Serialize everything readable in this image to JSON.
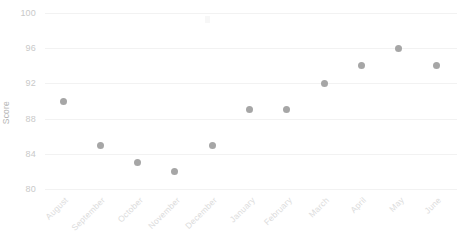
{
  "chart_data": {
    "type": "scatter",
    "title": "",
    "xlabel": "",
    "ylabel": "Score",
    "categories": [
      "August",
      "September",
      "October",
      "November",
      "December",
      "January",
      "February",
      "March",
      "April",
      "May",
      "June"
    ],
    "values": [
      90,
      85,
      83,
      82,
      85,
      89,
      89,
      92,
      94,
      96,
      94
    ],
    "series": [
      {
        "name": "Score",
        "values": [
          90,
          85,
          83,
          82,
          85,
          89,
          89,
          92,
          94,
          96,
          94
        ]
      }
    ],
    "ylim": [
      80,
      100
    ],
    "yticks": [
      80,
      84,
      88,
      92,
      96,
      100
    ],
    "ytick_labels": [
      "80",
      "84",
      "88",
      "92",
      "96",
      "100"
    ],
    "grid": true,
    "grid_axis": "y",
    "legend": false,
    "legend_position": "none",
    "marker": "circle",
    "marker_color": "#a6a6a6",
    "grid_color": "#f2f2f2",
    "axis_label_color": "#c9c9c9",
    "xtick_label_color": "#dcdcdc",
    "xtick_rotation": -45,
    "background_color": "#ffffff"
  }
}
